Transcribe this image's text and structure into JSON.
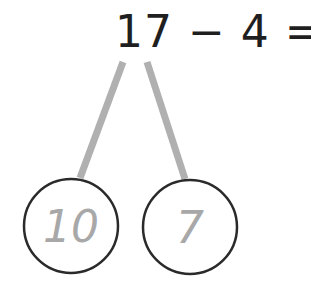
{
  "equation": {
    "text": "17 − 4 = ?",
    "minuend": "17",
    "operator": "−",
    "subtrahend": "4",
    "equals": "=",
    "unknown": "?"
  },
  "number_bond": {
    "parts": [
      {
        "label": "10"
      },
      {
        "label": "7"
      }
    ],
    "colors": {
      "text": "#1f1f1f",
      "circle_stroke": "#2a2a2a",
      "branch": "#b0b0b0",
      "part_text": "#a8a8a8"
    }
  }
}
